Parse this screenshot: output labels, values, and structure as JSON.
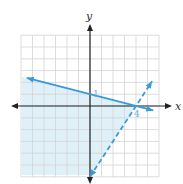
{
  "chart_data": {
    "type": "line",
    "title": "",
    "xlabel": "x",
    "ylabel": "y",
    "xlim": [
      -6,
      6
    ],
    "ylim": [
      -6,
      6
    ],
    "grid": true,
    "annotations": [
      {
        "text": "1",
        "x": 0,
        "y": 1
      },
      {
        "text": "4",
        "x": 4,
        "y": 0
      }
    ],
    "series": [
      {
        "name": "solid boundary",
        "style": "solid",
        "equation": "y = -x/4 + 1",
        "points": [
          [
            -5.5,
            2.375
          ],
          [
            0,
            1
          ],
          [
            4,
            0
          ],
          [
            5.5,
            -0.375
          ]
        ]
      },
      {
        "name": "dashed boundary",
        "style": "dashed",
        "equation": "y = 1.5x - 6",
        "points": [
          [
            0,
            -6
          ],
          [
            4,
            0
          ],
          [
            5.4,
            2.1
          ]
        ]
      }
    ],
    "shaded_region": "y <= -x/4 + 1 and y > 1.5x - 6"
  },
  "graph": {
    "x_axis_label": "x",
    "y_axis_label": "y",
    "y_intercept_label": "1",
    "x_intercept_label": "4",
    "colors": {
      "line": "#3a9ad9",
      "shade": "#dff0f9",
      "grid": "#d4d4d4",
      "axis": "#222222"
    }
  }
}
